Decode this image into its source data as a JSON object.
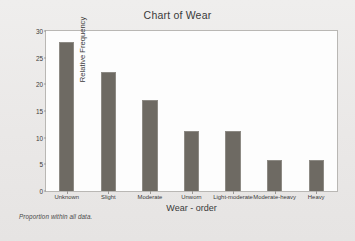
{
  "chart_data": {
    "type": "bar",
    "title": "Chart of Wear",
    "xlabel": "Wear - order",
    "ylabel": "Relative Frequency",
    "categories": [
      "Unknown",
      "Slight",
      "Moderate",
      "Unworn",
      "Light-moderate",
      "Moderate-heavy",
      "Heavy"
    ],
    "values": [
      28,
      22.4,
      17,
      11.3,
      11.3,
      5.8,
      5.8
    ],
    "ylim": [
      0,
      30
    ],
    "yticks": [
      0,
      5,
      10,
      15,
      20,
      25,
      30
    ],
    "ytick_labels": [
      "0",
      "5",
      "10",
      "15",
      "20",
      "25",
      "30"
    ],
    "grid": false,
    "legend": "none",
    "footnote": "Proportion within all data.",
    "bar_color": "#6e6a63",
    "plot_background": "#fdfdfd",
    "figure_background": "#eceaea"
  }
}
